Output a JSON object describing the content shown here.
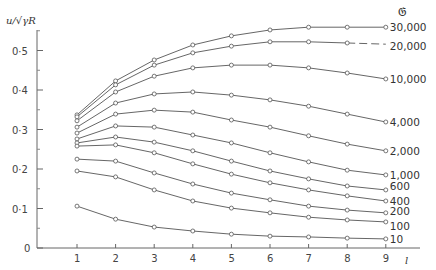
{
  "chart_data": {
    "type": "line",
    "title": "",
    "xlabel": "l",
    "ylabel": "u/√γR",
    "legend_title": "𝔊",
    "x": [
      1,
      2,
      3,
      4,
      5,
      6,
      7,
      8,
      9
    ],
    "xticks": [
      "1",
      "2",
      "3",
      "4",
      "5",
      "6",
      "7",
      "8",
      "9"
    ],
    "yticks": [
      "0",
      "0·1",
      "0·2",
      "0·3",
      "0·4",
      "0·5"
    ],
    "ylim": [
      0,
      0.56
    ],
    "xlim": [
      0,
      10
    ],
    "grid": false,
    "legend_position": "right, labels at line ends",
    "series": [
      {
        "name": "30,000",
        "values": [
          0.337,
          0.423,
          0.476,
          0.514,
          0.537,
          0.552,
          0.559,
          0.559,
          0.559
        ]
      },
      {
        "name": "20,000",
        "values": [
          0.332,
          0.413,
          0.463,
          0.494,
          0.511,
          0.522,
          0.522,
          0.519,
          0.516
        ],
        "dashed_tail": true
      },
      {
        "name": "10,000",
        "values": [
          0.322,
          0.395,
          0.435,
          0.456,
          0.463,
          0.463,
          0.456,
          0.443,
          0.428
        ]
      },
      {
        "name": "4,000",
        "values": [
          0.306,
          0.367,
          0.39,
          0.395,
          0.387,
          0.375,
          0.359,
          0.339,
          0.319
        ]
      },
      {
        "name": "2,000",
        "values": [
          0.291,
          0.339,
          0.349,
          0.344,
          0.324,
          0.306,
          0.284,
          0.263,
          0.246
        ]
      },
      {
        "name": "1,000",
        "values": [
          0.276,
          0.309,
          0.306,
          0.286,
          0.266,
          0.241,
          0.218,
          0.197,
          0.185
        ]
      },
      {
        "name": "600",
        "values": [
          0.266,
          0.281,
          0.268,
          0.246,
          0.22,
          0.195,
          0.175,
          0.157,
          0.147
        ]
      },
      {
        "name": "400",
        "values": [
          0.258,
          0.261,
          0.241,
          0.213,
          0.187,
          0.165,
          0.147,
          0.132,
          0.119
        ]
      },
      {
        "name": "200",
        "values": [
          0.225,
          0.22,
          0.19,
          0.162,
          0.139,
          0.122,
          0.106,
          0.096,
          0.089
        ]
      },
      {
        "name": "100",
        "values": [
          0.195,
          0.18,
          0.147,
          0.119,
          0.101,
          0.089,
          0.078,
          0.071,
          0.066
        ]
      },
      {
        "name": "10",
        "values": [
          0.106,
          0.073,
          0.053,
          0.043,
          0.035,
          0.03,
          0.028,
          0.025,
          0.023
        ]
      }
    ],
    "label_offsets_y": [
      0,
      2,
      0,
      0,
      0,
      0,
      -4,
      0,
      -2,
      4,
      0
    ]
  }
}
